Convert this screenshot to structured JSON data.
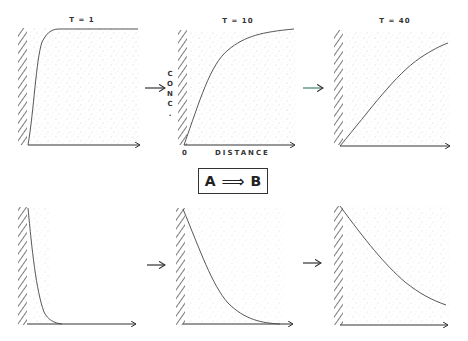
{
  "figure": {
    "top_row_label": "Concentration profile of reactant A near a surface over time",
    "panels_top": [
      {
        "title": "T = 1"
      },
      {
        "title": "T = 10"
      },
      {
        "title": "T = 40"
      }
    ],
    "axis_labels": {
      "ylabel_letters": [
        "C",
        "O",
        "N",
        "C",
        "."
      ],
      "xlabel": "DISTANCE",
      "origin": "0"
    },
    "reaction": {
      "reactant": "A",
      "arrow": "⟹",
      "product": "B"
    },
    "arrows": [
      "→",
      "→",
      "→",
      "→"
    ],
    "colors": {
      "ink": "#333333",
      "stipple": "#9a9a9a",
      "teal_arrow": "#3f7f6f"
    }
  }
}
